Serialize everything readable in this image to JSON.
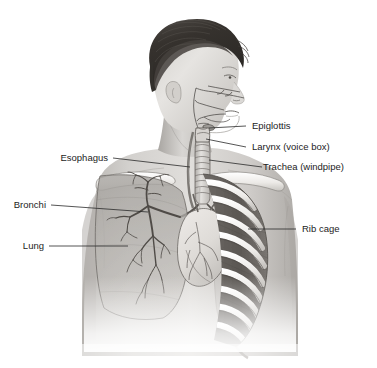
{
  "figure": {
    "background_color": "#ffffff",
    "ink_color": "#1c1c1c",
    "style": "grayscale medical illustration, head in profile with upper torso cutaway"
  },
  "labels": {
    "epiglottis": "Epiglottis",
    "larynx": "Larynx (voice box)",
    "trachea": "Trachea (windpipe)",
    "ribcage": "Rib cage",
    "esophagus": "Esophagus",
    "bronchi": "Bronchi",
    "lung": "Lung"
  },
  "anatomy_parts": [
    "head-profile",
    "hair",
    "nasal-cavity",
    "oral-cavity",
    "epiglottis",
    "larynx",
    "trachea",
    "esophagus",
    "clavicle-left",
    "clavicle-right",
    "rib-cage",
    "intercostal-muscle",
    "lung-translucent",
    "bronchial-tree",
    "heart",
    "torso-silhouette"
  ],
  "palette": {
    "hair_dark": "#3a3632",
    "hair_mid": "#54504b",
    "skin_light": "#e2e0dd",
    "skin_mid": "#c9c6c2",
    "skin_shadow": "#a8a5a1",
    "bone_white": "#f4f3f1",
    "muscle_dark": "#6b6763",
    "lung_fill": "#b5b2ae",
    "organ_light": "#ddd9d5",
    "outline": "#55514d"
  }
}
